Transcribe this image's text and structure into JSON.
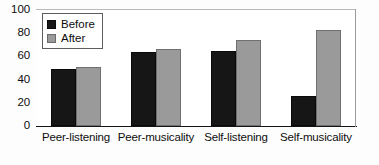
{
  "chart_data": {
    "type": "bar",
    "title": "",
    "subtitle": "",
    "xlabel": "",
    "ylabel": "",
    "ylim": [
      0,
      100
    ],
    "yticks": [
      0,
      20,
      40,
      60,
      80,
      100
    ],
    "ytick_labels": [
      "0",
      "20",
      "40",
      "60",
      "80",
      "100"
    ],
    "grid": false,
    "legend_position": "top-left-inside",
    "categories": [
      "Peer-listening",
      "Peer-musicality",
      "Self-listening",
      "Self-musicality"
    ],
    "series": [
      {
        "name": "Before",
        "color": "#161616",
        "values": [
          49,
          64,
          65,
          26
        ]
      },
      {
        "name": "After",
        "color": "#9a9a9a",
        "values": [
          51,
          66,
          74,
          83
        ]
      }
    ],
    "annotations": []
  },
  "legend": {
    "items": [
      {
        "label": "Before",
        "swatch": "before-swatch"
      },
      {
        "label": "After",
        "swatch": "after-swatch"
      }
    ]
  }
}
